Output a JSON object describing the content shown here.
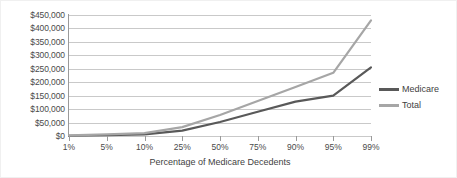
{
  "chart_data": {
    "type": "line",
    "title": "",
    "xlabel": "Percentage of Medicare Decedents",
    "ylabel": "",
    "categories": [
      "1%",
      "5%",
      "10%",
      "25%",
      "50%",
      "75%",
      "90%",
      "95%",
      "99%"
    ],
    "ylim": [
      0,
      450000
    ],
    "ytick_labels": [
      "$450,000",
      "$400,000",
      "$350,000",
      "$300,000",
      "$250,000",
      "$200,000",
      "$150,000",
      "$100,000",
      "$50,000",
      "$0"
    ],
    "ytick_values": [
      450000,
      400000,
      350000,
      300000,
      250000,
      200000,
      150000,
      100000,
      50000,
      0
    ],
    "grid": true,
    "legend_position": "right",
    "series": [
      {
        "name": "Medicare",
        "color": "#595959",
        "values": [
          1000,
          3000,
          6000,
          20000,
          52000,
          90000,
          128000,
          150000,
          255000
        ]
      },
      {
        "name": "Total",
        "color": "#a6a6a6",
        "values": [
          2000,
          6000,
          11000,
          33000,
          78000,
          130000,
          182000,
          235000,
          430000
        ]
      }
    ]
  },
  "legend": {
    "items": [
      {
        "label": "Medicare"
      },
      {
        "label": "Total"
      }
    ]
  },
  "colors": {
    "medicare": "#595959",
    "total": "#a6a6a6",
    "gridline": "#c9c9c9",
    "axis": "#9a9a9a",
    "text": "#4a4a4a"
  }
}
